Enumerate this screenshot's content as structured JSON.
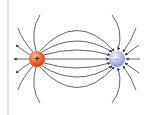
{
  "diagram": {
    "charges": [
      {
        "id": "positive",
        "sign": "+",
        "cx": 37,
        "cy": 59,
        "r": 8,
        "color": "#e8552a",
        "highlight": "#ffb48a"
      },
      {
        "id": "negative",
        "sign": "−",
        "cx": 117,
        "cy": 59,
        "r": 8,
        "color": "#8aa4d8",
        "highlight": "#eef2fb"
      }
    ],
    "line_color": "#3a3a3a",
    "rule_color": "#e9e8df"
  }
}
